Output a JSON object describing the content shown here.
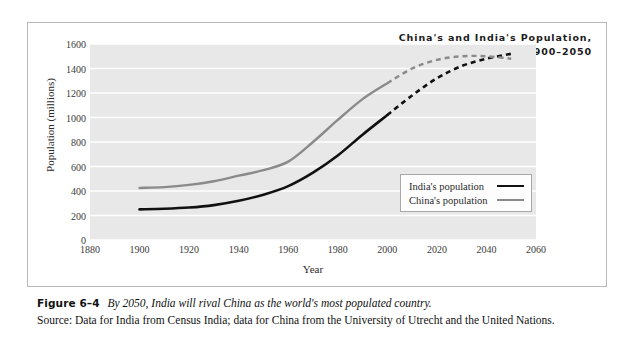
{
  "chart_data": {
    "type": "line",
    "title": "China's and India's Population,",
    "subtitle": "1900–2050",
    "xlabel": "Year",
    "ylabel": "Population (millions)",
    "xlim": [
      1880,
      2060
    ],
    "ylim": [
      0,
      1600
    ],
    "xticks": [
      1880,
      1900,
      1920,
      1940,
      1960,
      1980,
      2000,
      2020,
      2040,
      2060
    ],
    "yticks": [
      0,
      200,
      400,
      600,
      800,
      1000,
      1200,
      1400,
      1600
    ],
    "grid": "horizontal",
    "legend_position": "center-right",
    "series": [
      {
        "name": "India's population",
        "color": "#111111",
        "x": [
          1900,
          1910,
          1920,
          1930,
          1940,
          1950,
          1960,
          1970,
          1980,
          1990,
          2000,
          2010,
          2020,
          2030,
          2040,
          2050
        ],
        "values": [
          250,
          255,
          265,
          285,
          320,
          370,
          440,
          550,
          690,
          860,
          1020,
          1180,
          1320,
          1420,
          1480,
          1520
        ],
        "solid_until": 2000,
        "style_after": "dashed"
      },
      {
        "name": "China's population",
        "color": "#8a8a8a",
        "x": [
          1900,
          1910,
          1920,
          1930,
          1940,
          1950,
          1960,
          1970,
          1980,
          1990,
          2000,
          2010,
          2020,
          2030,
          2040,
          2050
        ],
        "values": [
          425,
          432,
          450,
          480,
          525,
          570,
          640,
          800,
          980,
          1150,
          1280,
          1400,
          1470,
          1500,
          1500,
          1480
        ],
        "solid_until": 2000,
        "style_after": "dashed"
      }
    ]
  },
  "legend": {
    "items": [
      {
        "label": "India's population"
      },
      {
        "label": "China's population"
      }
    ]
  },
  "caption": {
    "figure_number": "Figure 6–4",
    "description": "By 2050, India will rival China as the world's most populated country.",
    "source": "Source: Data for India from Census India; data for China from the University of Utrecht and the United Nations."
  },
  "colors": {
    "india": "#111111",
    "china": "#8a8a8a",
    "plot_background": "#e8e8e8",
    "gridline": "#ffffff",
    "frame_border": "#b9b9b9"
  }
}
